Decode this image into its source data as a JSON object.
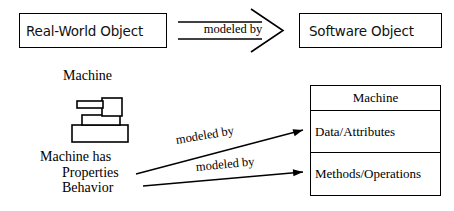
{
  "diagram": {
    "title": "Real-World Object modeled by Software Object",
    "top_flow": {
      "source_box_label": "Real-World Object",
      "arrow_label": "modeled by",
      "target_box_label": "Software Object"
    },
    "real_world_side": {
      "icon_caption": "Machine",
      "icon_name": "machine-illustration",
      "attributes_heading": "Machine has",
      "attribute_items": [
        "Properties",
        "Behavior"
      ]
    },
    "mapping_arrows": [
      {
        "label": "modeled by",
        "from": "Properties",
        "to": "Data/Attributes"
      },
      {
        "label": "modeled by",
        "from": "Behavior",
        "to": "Methods/Operations"
      }
    ],
    "class_box": {
      "name": "Machine",
      "compartments": [
        "Data/Attributes",
        "Methods/Operations"
      ]
    },
    "colors": {
      "stroke": "#000000",
      "fill": "#ffffff",
      "text": "#000000"
    }
  }
}
